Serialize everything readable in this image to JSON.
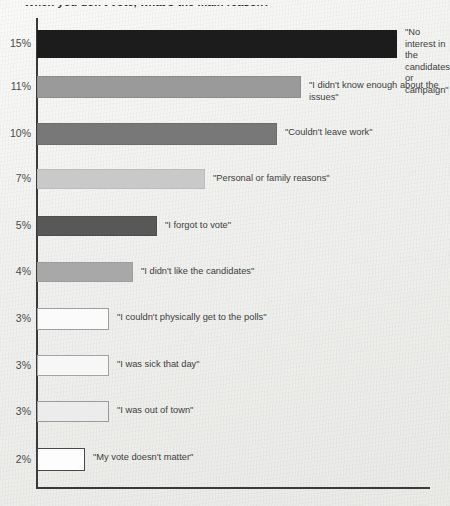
{
  "chart_data": {
    "type": "bar",
    "orientation": "horizontal",
    "title": "When you don't vote, what's the main reason?",
    "xlabel": "",
    "ylabel": "",
    "grid": false,
    "legend": false,
    "xlim": [
      0,
      15
    ],
    "categories": [
      "\"No interest in the\ncandidates or\ncampaign\"",
      "\"I didn't know enough about the issues\"",
      "\"Couldn't leave work\"",
      "\"Personal or family reasons\"",
      "\"I forgot to vote\"",
      "\"I didn't like the candidates\"",
      "\"I couldn't physically get to the polls\"",
      "\"I was sick that day\"",
      "\"I was out of town\"",
      "\"My vote doesn't matter\""
    ],
    "tick_labels": [
      "15%",
      "11%",
      "10%",
      "7%",
      "5%",
      "4%",
      "3%",
      "3%",
      "3%",
      "2%"
    ],
    "values": [
      15,
      11,
      10,
      7,
      5,
      4,
      3,
      3,
      3,
      2
    ],
    "colors": [
      "#1c1c1c",
      "#9a9a9a",
      "#787878",
      "#c9c9c9",
      "#585858",
      "#a8a8a8",
      "#fbfbfb",
      "#f7f7f7",
      "#ececec",
      "#fdfdfd"
    ],
    "bar_borders": [
      "#1c1c1c",
      "#8d8d8d",
      "#6d6d6d",
      "#bcbcbc",
      "#4d4d4d",
      "#9c9c9c",
      "#9e9e9e",
      "#a3a3a3",
      "#9a9a9a",
      "#4a4a4a"
    ],
    "axis_color": "#3a3a3a",
    "background_color": "#f2f2f0"
  }
}
